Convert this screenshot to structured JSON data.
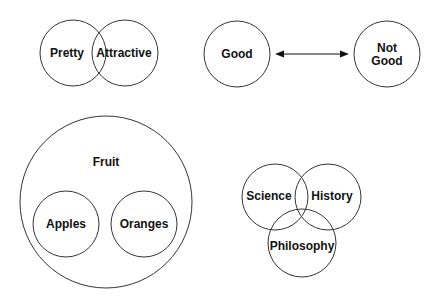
{
  "diagrams": {
    "overlap": {
      "left_label": "Pretty",
      "right_label": "Attractive"
    },
    "opposites": {
      "left_label": "Good",
      "right_label_line1": "Not",
      "right_label_line2": "Good",
      "connector": "double-arrow"
    },
    "containment": {
      "outer_label": "Fruit",
      "inner_left_label": "Apples",
      "inner_right_label": "Oranges"
    },
    "triple_overlap": {
      "top_left_label": "Science",
      "top_right_label": "History",
      "bottom_label": "Philosophy"
    }
  },
  "colors": {
    "stroke": "#333333",
    "text": "#111111",
    "background": "#ffffff"
  }
}
